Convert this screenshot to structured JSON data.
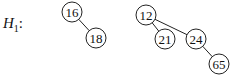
{
  "label": {
    "name": "H",
    "subscript": "1",
    "suffix": ":"
  },
  "trees": [
    {
      "nodes": [
        {
          "id": "n16",
          "value": "16",
          "cx": 72,
          "cy": 12
        },
        {
          "id": "n18",
          "value": "18",
          "cx": 96,
          "cy": 38
        }
      ],
      "edges": [
        [
          "n16",
          "n18"
        ]
      ]
    },
    {
      "nodes": [
        {
          "id": "n12",
          "value": "12",
          "cx": 146,
          "cy": 15
        },
        {
          "id": "n21",
          "value": "21",
          "cx": 165,
          "cy": 39
        },
        {
          "id": "n24",
          "value": "24",
          "cx": 196,
          "cy": 39
        },
        {
          "id": "n65",
          "value": "65",
          "cx": 219,
          "cy": 64
        }
      ],
      "edges": [
        [
          "n12",
          "n21"
        ],
        [
          "n12",
          "n24"
        ],
        [
          "n24",
          "n65"
        ]
      ]
    }
  ],
  "style": {
    "stroke": "#222222",
    "node_radius": 10
  }
}
